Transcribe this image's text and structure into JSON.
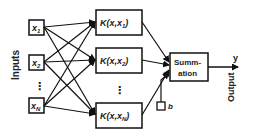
{
  "diagram": {
    "type": "kernel-machine-network",
    "side_labels": {
      "inputs": "Inputs",
      "output": "Output"
    },
    "inputs": [
      {
        "name": "x",
        "sub": "1"
      },
      {
        "name": "x",
        "sub": "2"
      },
      {
        "name": "x",
        "sub": "N"
      }
    ],
    "input_ellipsis": "⋮",
    "kernels": [
      {
        "prefix": "K(x,x",
        "sub": "1",
        "suffix": ")"
      },
      {
        "prefix": "K(x,x",
        "sub": "2",
        "suffix": ")"
      },
      {
        "prefix": "K(x,x",
        "sub": "N",
        "suffix": ")"
      }
    ],
    "kernel_ellipsis": "⋮",
    "summation": {
      "line1": "Summ-",
      "line2": "ation"
    },
    "bias": "b",
    "output_symbol": "y",
    "colors": {
      "stroke": "#111111",
      "background": "#ffffff",
      "text": "#222222"
    }
  }
}
